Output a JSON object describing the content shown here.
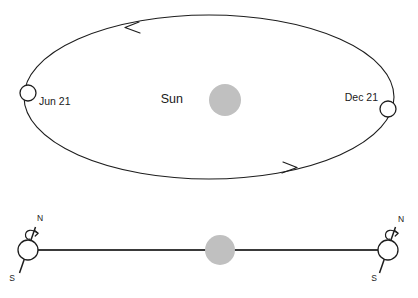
{
  "diagram": {
    "colors": {
      "stroke": "#1d1d1d",
      "sun_fill": "#c0c0c0",
      "earth_fill": "#ffffff",
      "plane_line": "#3a3a3a",
      "background": "#ffffff"
    },
    "orbit_panel": {
      "sun_label": "Sun",
      "sun": {
        "cx": 225,
        "cy": 100,
        "r": 16,
        "fill": "#c0c0c0"
      },
      "ellipse": {
        "cx": 209,
        "cy": 97,
        "rx": 185,
        "ry": 82
      },
      "positions": [
        {
          "name": "june-solstice-position",
          "label": "Jun 21",
          "marker": {
            "cx": 28,
            "cy": 93,
            "r": 8
          },
          "label_x": 39,
          "label_y": 102
        },
        {
          "name": "december-solstice-position",
          "label": "Dec 21",
          "marker": {
            "cx": 388,
            "cy": 109,
            "r": 8
          },
          "label_x": 344,
          "label_y": 98
        }
      ],
      "direction_arrows": [
        {
          "name": "orbit-direction-arrow-top",
          "direction": "left",
          "x": 126,
          "y": 27
        },
        {
          "name": "orbit-direction-arrow-bottom",
          "direction": "right",
          "x": 295,
          "y": 167
        }
      ]
    },
    "side_panel": {
      "sun": {
        "cx": 220,
        "cy": 250,
        "r": 15,
        "fill": "#c0c0c0"
      },
      "plane_line": {
        "x1": 28,
        "y1": 250,
        "x2": 388,
        "y2": 250
      },
      "earths": [
        {
          "name": "earth-left",
          "marker": {
            "cx": 28,
            "cy": 250,
            "r": 10
          },
          "north_label": "N",
          "south_label": "S",
          "north_label_x": 37,
          "north_label_y": 219,
          "south_label_x": 12,
          "south_label_y": 278,
          "axis": {
            "x1": 35,
            "y1": 228,
            "x2": 20,
            "y2": 272
          },
          "rotation_arrow": "counterclockwise"
        },
        {
          "name": "earth-right",
          "marker": {
            "cx": 388,
            "cy": 250,
            "r": 10
          },
          "north_label": "N",
          "south_label": "S",
          "north_label_x": 398,
          "north_label_y": 220,
          "south_label_x": 374,
          "south_label_y": 278,
          "axis": {
            "x1": 395,
            "y1": 228,
            "x2": 380,
            "y2": 272
          },
          "rotation_arrow": "counterclockwise"
        }
      ]
    }
  }
}
